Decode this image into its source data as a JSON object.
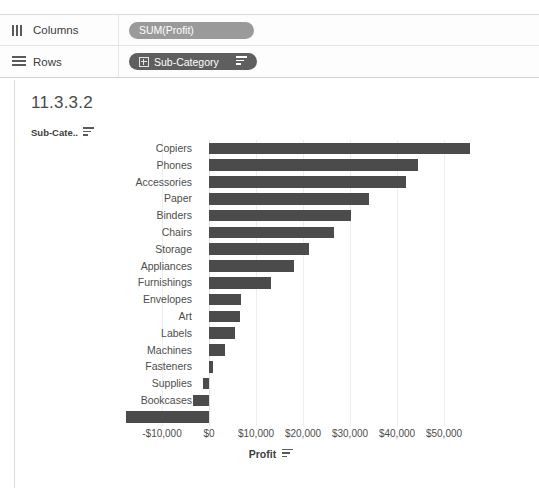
{
  "shelves": {
    "columns": {
      "label": "Columns",
      "icon": "columns-icon",
      "pill": {
        "text": "SUM(Profit)",
        "type": "measure"
      }
    },
    "rows": {
      "label": "Rows",
      "icon": "rows-icon",
      "pill": {
        "text": "Sub-Category",
        "type": "dimension",
        "expand_icon": "plus-box-icon",
        "sort_icon": "sort-descending-icon"
      }
    }
  },
  "worksheet": {
    "title": "11.3.3.2",
    "row_field_header": "Sub-Cate..",
    "row_field_sort_icon": "sort-descending-icon",
    "axis_title": "Profit",
    "axis_title_sort_icon": "sort-descending-icon"
  },
  "colors": {
    "bar": "#4b4b4b",
    "measure_pill": "#9a9a9a",
    "dimension_pill": "#5f5f5f",
    "gridline": "#ededed",
    "text": "#4d4d4d"
  },
  "chart_data": {
    "type": "bar",
    "orientation": "horizontal",
    "title": "11.3.3.2",
    "xlabel": "Profit",
    "ylabel": "Sub-Cate..",
    "xlim": [
      -20000,
      57000
    ],
    "grid": true,
    "legend": "none",
    "xticks": [
      "-$10,000",
      "$0",
      "$10,000",
      "$20,000",
      "$30,000",
      "$40,000",
      "$50,000"
    ],
    "xtick_values": [
      -10000,
      0,
      10000,
      20000,
      30000,
      40000,
      50000
    ],
    "categories": [
      "Copiers",
      "Phones",
      "Accessories",
      "Paper",
      "Binders",
      "Chairs",
      "Storage",
      "Appliances",
      "Furnishings",
      "Envelopes",
      "Art",
      "Labels",
      "Machines",
      "Fasteners",
      "Supplies",
      "Bookcases",
      "Tables"
    ],
    "values": [
      55600,
      44500,
      41900,
      34000,
      30200,
      26600,
      21300,
      18100,
      13100,
      6900,
      6500,
      5500,
      3400,
      950,
      -1200,
      -3500,
      -17700
    ]
  }
}
